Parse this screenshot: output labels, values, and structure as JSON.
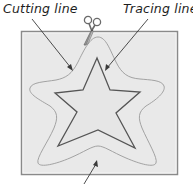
{
  "labels": {
    "cutting_line": "Cutting line",
    "tracing_line": "Tracing line"
  },
  "colors": {
    "paper_fill": "#e9e9e9",
    "paper_border": "#8a8a8a",
    "tracing_line": "#555555",
    "cutting_line": "#9a9a9a",
    "arrow": "#3a3a3a",
    "text": "#1e1e1e"
  },
  "icons": {
    "scissors": "scissors-icon"
  }
}
